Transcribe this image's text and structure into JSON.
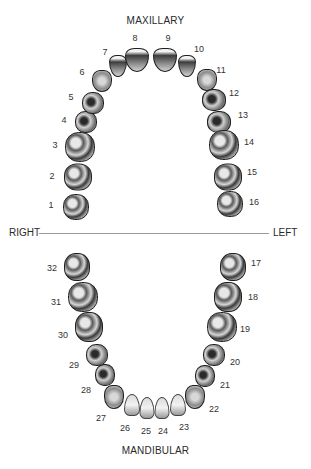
{
  "labels": {
    "top_title": "MAXILLARY",
    "bottom_title": "MANDIBULAR",
    "right": "RIGHT",
    "left": "LEFT"
  },
  "teeth": [
    {
      "n": "1",
      "type": "molar",
      "x": 76,
      "y": 207,
      "w": 26,
      "h": 26,
      "lx": 51,
      "ly": 205
    },
    {
      "n": "2",
      "type": "molar",
      "x": 78,
      "y": 177,
      "w": 28,
      "h": 27,
      "lx": 52,
      "ly": 176
    },
    {
      "n": "3",
      "type": "molar",
      "x": 80,
      "y": 147,
      "w": 30,
      "h": 30,
      "lx": 55,
      "ly": 145
    },
    {
      "n": "4",
      "type": "premolar",
      "x": 86,
      "y": 122,
      "w": 22,
      "h": 22,
      "lx": 64,
      "ly": 120
    },
    {
      "n": "5",
      "type": "premolar",
      "x": 93,
      "y": 103,
      "w": 22,
      "h": 22,
      "lx": 71,
      "ly": 97
    },
    {
      "n": "6",
      "type": "canine",
      "x": 102,
      "y": 81,
      "w": 20,
      "h": 22,
      "lx": 82,
      "ly": 72
    },
    {
      "n": "7",
      "type": "incisor-up",
      "x": 118,
      "y": 66,
      "w": 18,
      "h": 22,
      "lx": 105,
      "ly": 52
    },
    {
      "n": "8",
      "type": "incisor-up",
      "x": 137,
      "y": 60,
      "w": 24,
      "h": 24,
      "lx": 135,
      "ly": 38
    },
    {
      "n": "9",
      "type": "incisor-up",
      "x": 165,
      "y": 60,
      "w": 24,
      "h": 24,
      "lx": 168,
      "ly": 38
    },
    {
      "n": "10",
      "type": "incisor-up",
      "x": 187,
      "y": 66,
      "w": 18,
      "h": 22,
      "lx": 199,
      "ly": 49
    },
    {
      "n": "11",
      "type": "canine",
      "x": 207,
      "y": 80,
      "w": 20,
      "h": 22,
      "lx": 221,
      "ly": 70
    },
    {
      "n": "12",
      "type": "premolar",
      "x": 214,
      "y": 100,
      "w": 24,
      "h": 22,
      "lx": 234,
      "ly": 93
    },
    {
      "n": "13",
      "type": "premolar",
      "x": 219,
      "y": 122,
      "w": 24,
      "h": 22,
      "lx": 243,
      "ly": 115
    },
    {
      "n": "14",
      "type": "molar",
      "x": 224,
      "y": 145,
      "w": 30,
      "h": 30,
      "lx": 249,
      "ly": 142
    },
    {
      "n": "15",
      "type": "molar",
      "x": 228,
      "y": 177,
      "w": 28,
      "h": 27,
      "lx": 252,
      "ly": 172
    },
    {
      "n": "16",
      "type": "molar",
      "x": 230,
      "y": 204,
      "w": 26,
      "h": 26,
      "lx": 254,
      "ly": 202
    },
    {
      "n": "17",
      "type": "molar",
      "x": 233,
      "y": 267,
      "w": 26,
      "h": 28,
      "lx": 256,
      "ly": 263
    },
    {
      "n": "18",
      "type": "molar",
      "x": 228,
      "y": 297,
      "w": 28,
      "h": 30,
      "lx": 253,
      "ly": 297
    },
    {
      "n": "19",
      "type": "molar",
      "x": 222,
      "y": 327,
      "w": 30,
      "h": 30,
      "lx": 245,
      "ly": 329
    },
    {
      "n": "20",
      "type": "premolar",
      "x": 214,
      "y": 355,
      "w": 22,
      "h": 22,
      "lx": 235,
      "ly": 362
    },
    {
      "n": "21",
      "type": "premolar",
      "x": 205,
      "y": 376,
      "w": 20,
      "h": 22,
      "lx": 225,
      "ly": 385
    },
    {
      "n": "22",
      "type": "canine",
      "x": 195,
      "y": 397,
      "w": 20,
      "h": 24,
      "lx": 214,
      "ly": 409
    },
    {
      "n": "23",
      "type": "incisor-low",
      "x": 178,
      "y": 405,
      "w": 16,
      "h": 22,
      "lx": 184,
      "ly": 427
    },
    {
      "n": "24",
      "type": "incisor-low",
      "x": 162,
      "y": 408,
      "w": 15,
      "h": 22,
      "lx": 163,
      "ly": 431
    },
    {
      "n": "25",
      "type": "incisor-low",
      "x": 147,
      "y": 408,
      "w": 15,
      "h": 22,
      "lx": 146,
      "ly": 431
    },
    {
      "n": "26",
      "type": "incisor-low",
      "x": 132,
      "y": 405,
      "w": 16,
      "h": 22,
      "lx": 125,
      "ly": 428
    },
    {
      "n": "27",
      "type": "canine",
      "x": 114,
      "y": 397,
      "w": 20,
      "h": 24,
      "lx": 101,
      "ly": 418
    },
    {
      "n": "28",
      "type": "premolar",
      "x": 105,
      "y": 375,
      "w": 20,
      "h": 22,
      "lx": 86,
      "ly": 390
    },
    {
      "n": "29",
      "type": "premolar",
      "x": 97,
      "y": 355,
      "w": 22,
      "h": 22,
      "lx": 74,
      "ly": 365
    },
    {
      "n": "30",
      "type": "molar",
      "x": 89,
      "y": 327,
      "w": 28,
      "h": 30,
      "lx": 63,
      "ly": 335
    },
    {
      "n": "31",
      "type": "molar",
      "x": 83,
      "y": 297,
      "w": 30,
      "h": 30,
      "lx": 56,
      "ly": 302
    },
    {
      "n": "32",
      "type": "molar",
      "x": 77,
      "y": 267,
      "w": 26,
      "h": 28,
      "lx": 52,
      "ly": 268
    }
  ]
}
